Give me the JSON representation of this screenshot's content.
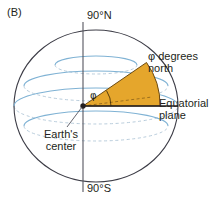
{
  "figure": {
    "panel_label": "(B)",
    "background_color": "#ffffff"
  },
  "labels": {
    "north_pole": "90°N",
    "south_pole": "90°S",
    "phi_degrees_north": "φ degrees\nnorth",
    "equatorial_plane": "Equatorial\nplane",
    "earths_center": "Earth's\ncenter",
    "angle_symbol": "φ"
  },
  "colors": {
    "wedge_fill": "#e5a62c",
    "wedge_stroke": "#6b4a12",
    "sphere_outline": "#3c3c46",
    "latitude_line": "#7fb2d4",
    "latitude_line_hidden": "#b9cddc",
    "axis_line": "#55555f",
    "text": "#231f20",
    "equator_line": "#231f20",
    "leader_line": "#55555f"
  },
  "geometry": {
    "sphere_center_x": 96,
    "sphere_center_y": 106,
    "sphere_radius_x": 82,
    "sphere_radius_y": 76,
    "polar_axis_x": 83,
    "earth_center_x": 83,
    "earth_center_y": 106,
    "latitude_values_deg": [
      60,
      30,
      0,
      -30,
      -60
    ],
    "wedge_angle_deg": 33,
    "angle_arc_radius": 28
  }
}
